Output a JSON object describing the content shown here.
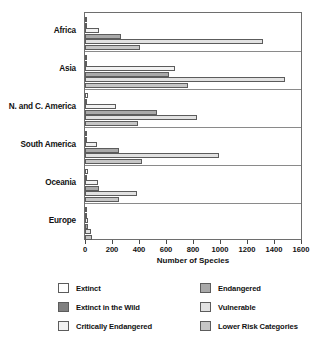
{
  "chart_data": {
    "type": "bar",
    "orientation": "horizontal",
    "title": "",
    "xlabel": "Number of Species",
    "ylabel": "",
    "xlim": [
      0,
      1600
    ],
    "xticks": [
      0,
      200,
      400,
      600,
      800,
      1000,
      1200,
      1400,
      1600
    ],
    "xtick_labels": [
      "0",
      "200",
      "400",
      "600",
      "800",
      "1000",
      "1200",
      "1400",
      "1600"
    ],
    "grid": false,
    "legend_position": "bottom",
    "categories": [
      "Africa",
      "Asia",
      "N. and C. America",
      "South America",
      "Oceania",
      "Europe"
    ],
    "series": [
      {
        "name": "Extinct",
        "color": "#ffffff",
        "values": [
          8,
          8,
          25,
          8,
          20,
          10
        ]
      },
      {
        "name": "Extinct in the Wild",
        "color": "#808080",
        "values": [
          2,
          6,
          5,
          2,
          3,
          5
        ]
      },
      {
        "name": "Critically Endangered",
        "color": "#f2f2f2",
        "values": [
          100,
          670,
          230,
          90,
          95,
          25
        ]
      },
      {
        "name": "Endangered",
        "color": "#a9a9a9",
        "values": [
          265,
          620,
          535,
          250,
          105,
          20
        ]
      },
      {
        "name": "Vulnerable",
        "color": "#e2e2e2",
        "values": [
          1320,
          1480,
          830,
          990,
          385,
          45
        ]
      },
      {
        "name": "Lower Risk Categories",
        "color": "#c6c6c6",
        "values": [
          410,
          765,
          395,
          420,
          250,
          50
        ]
      }
    ]
  },
  "axis": {
    "x_title": "Number of Species"
  },
  "legend": {
    "items": [
      {
        "label": "Extinct",
        "color": "#ffffff"
      },
      {
        "label": "Endangered",
        "color": "#a9a9a9"
      },
      {
        "label": "Extinct in the Wild",
        "color": "#808080"
      },
      {
        "label": "Vulnerable",
        "color": "#e2e2e2"
      },
      {
        "label": "Critically Endangered",
        "color": "#f2f2f2"
      },
      {
        "label": "Lower Risk Categories",
        "color": "#c6c6c6"
      }
    ]
  }
}
